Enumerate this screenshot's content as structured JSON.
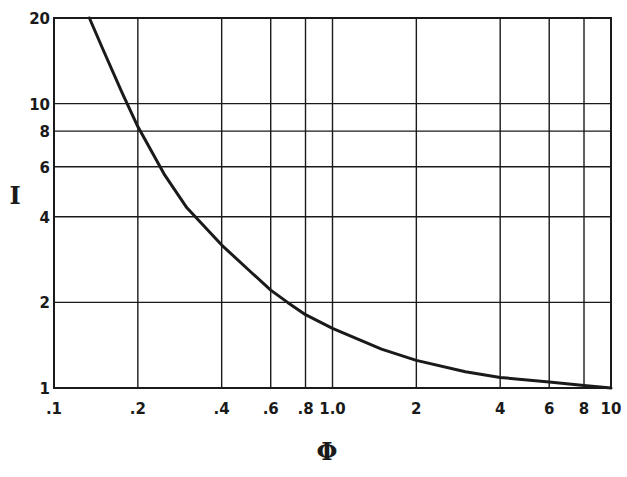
{
  "chart_data": {
    "type": "line",
    "title": "",
    "xlabel": "Φ",
    "ylabel": "I",
    "xscale": "log",
    "yscale": "log",
    "xlim": [
      0.1,
      10
    ],
    "ylim": [
      1,
      20
    ],
    "grid": true,
    "legend": null,
    "x_ticks": [
      0.1,
      0.2,
      0.4,
      0.6,
      0.8,
      1.0,
      2,
      4,
      6,
      8,
      10
    ],
    "x_tick_labels": [
      ".1",
      ".2",
      ".4",
      ".6",
      ".8",
      "1.0",
      "2",
      "4",
      "6",
      "8",
      "10"
    ],
    "y_ticks": [
      1,
      2,
      4,
      6,
      8,
      10,
      20
    ],
    "y_tick_labels": [
      "1",
      "2",
      "4",
      "6",
      "8",
      "10",
      "20"
    ],
    "series": [
      {
        "name": "I vs Φ",
        "x": [
          0.134,
          0.15,
          0.175,
          0.2,
          0.25,
          0.3,
          0.4,
          0.5,
          0.6,
          0.69,
          0.8,
          1.0,
          1.5,
          2,
          3,
          4,
          6,
          8,
          10
        ],
        "y": [
          20,
          15.5,
          11.0,
          8.3,
          5.6,
          4.3,
          3.18,
          2.6,
          2.21,
          2.0,
          1.81,
          1.62,
          1.37,
          1.25,
          1.14,
          1.09,
          1.05,
          1.02,
          1.0
        ]
      }
    ]
  },
  "plot": {
    "left": 54,
    "right": 611,
    "top": 18,
    "bottom": 388,
    "line_color": "#1a1a1a"
  }
}
